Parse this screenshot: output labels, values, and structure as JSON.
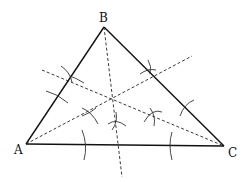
{
  "diagram": {
    "title": "",
    "vertices": [
      {
        "name": "A",
        "label": "A"
      },
      {
        "name": "B",
        "label": "B"
      },
      {
        "name": "C",
        "label": "C"
      }
    ],
    "colors": {
      "stroke": "#111111",
      "background": "#ffffff"
    }
  }
}
